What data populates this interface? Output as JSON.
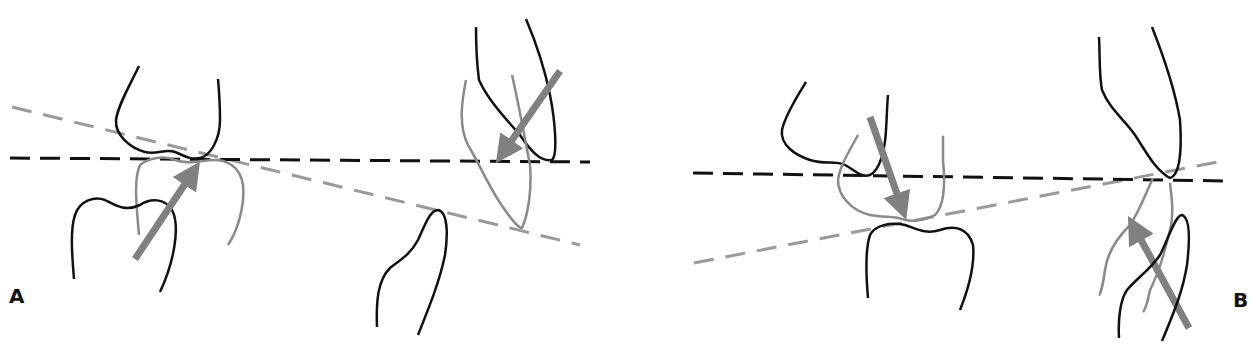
{
  "figure": {
    "panels": [
      {
        "id": "A",
        "label": "A",
        "elements": [
          "upper tooth outline (black)",
          "lower tooth outline (black)",
          "displaced tooth outline (gray)",
          "horizontal reference line (black dashed)",
          "tilted occlusal plane (gray dashed)",
          "force arrow pointing up-right (gray)",
          "incisor contact with force arrow pointing down-left"
        ]
      },
      {
        "id": "B",
        "label": "B",
        "elements": [
          "upper tooth outline (black)",
          "lower tooth outline (black)",
          "displaced tooth outline (gray)",
          "horizontal reference line (black dashed)",
          "tilted occlusal plane (gray dashed)",
          "force arrow pointing down (gray)",
          "incisor contact with force arrow pointing up-left"
        ]
      }
    ],
    "colors": {
      "outline": "#111111",
      "displaced_outline": "#8a8a8a",
      "reference_line": "#111111",
      "occlusal_plane": "#9a9a9a",
      "arrow": "#808080",
      "background": "#ffffff"
    }
  }
}
